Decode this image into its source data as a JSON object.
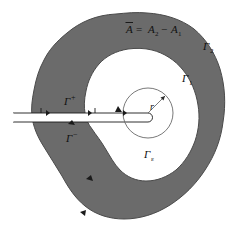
{
  "figure": {
    "kind": "math-diagram",
    "colors": {
      "region_fill": "#6b6b6b",
      "region_stroke": "#4a4a4a",
      "hole_fill": "#ffffff",
      "line": "#1a1a1a",
      "background": "#ffffff"
    }
  },
  "labels": {
    "area_relation": {
      "text": "A = A2 − A1",
      "overbar_symbol": "Ā",
      "parts": {
        "lhs": "A",
        "eq": "=",
        "a2": "A",
        "a2_sub": "2",
        "minus": "−",
        "a1": "A",
        "a1_sub": "1"
      },
      "x": 140,
      "y": 30
    },
    "gamma_2": {
      "base": "Γ",
      "sub": "2",
      "x": 208,
      "y": 48
    },
    "gamma_1": {
      "base": "Γ",
      "sub": "1",
      "x": 187,
      "y": 80
    },
    "gamma_plus": {
      "base": "Γ",
      "sup": "+",
      "x": 72,
      "y": 100
    },
    "gamma_minus": {
      "base": "Γ",
      "sup": "−",
      "x": 73,
      "y": 137
    },
    "gamma_epsilon": {
      "base": "Γ",
      "sub": "ε",
      "x": 150,
      "y": 156
    },
    "radius": {
      "text": "r",
      "x": 153,
      "y": 113
    }
  },
  "geometry": {
    "circle": {
      "cx": 148,
      "cy": 113,
      "r": 25
    },
    "radius_arrow": {
      "x1": 148,
      "y1": 113,
      "x2": 166,
      "y2": 95
    },
    "slit": {
      "x_left": 13,
      "x_right": 148,
      "y_top": 113,
      "y_bottom": 122
    }
  }
}
